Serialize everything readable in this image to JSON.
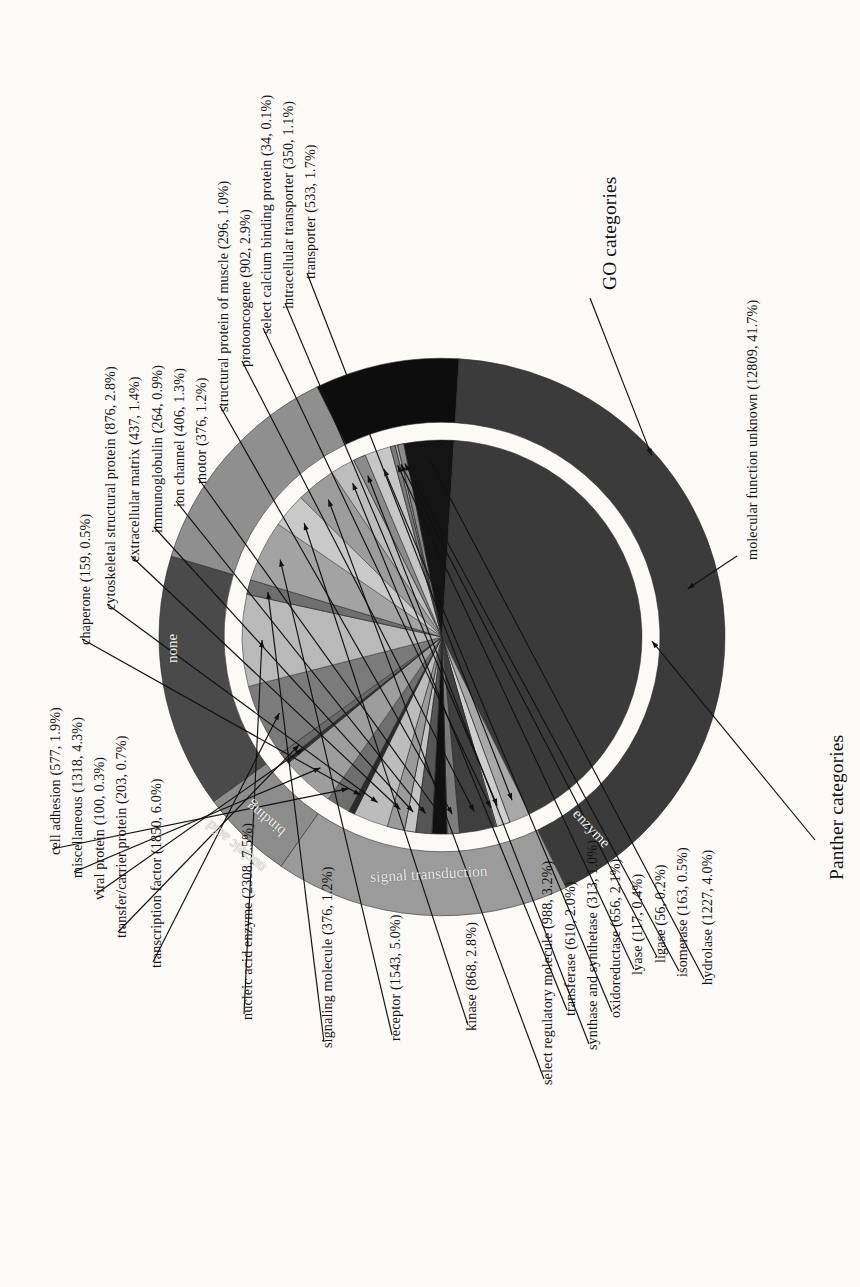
{
  "figure": {
    "title_go": "GO categories",
    "title_panther": "Panther categories"
  },
  "ring_labels": {
    "none": "none",
    "nucleic_acid_binding": "nucleic acid\nbinding",
    "nucleic_acid": "nucleic acid",
    "binding": "binding",
    "signal_transduction": "signal transduction",
    "enzyme": "enzyme"
  },
  "callouts": {
    "molecular_function_unknown": "molecular function unknown (12809, 41.7%)",
    "go_categories": "GO categories",
    "panther_categories": "Panther categories"
  },
  "chart_data": {
    "type": "pie",
    "subtitle": "",
    "xlabel": "",
    "ylabel": "",
    "legend_position": "callout-labels",
    "grid": false,
    "rings": [
      {
        "name": "Panther categories (outer ring)",
        "slices": [
          {
            "label": "molecular function unknown",
            "count": 12809,
            "percent": 41.7,
            "color": "#3b3b3b"
          },
          {
            "label": "none",
            "count": null,
            "percent": null,
            "color": "#8f8f8f"
          },
          {
            "label": "nucleic acid binding",
            "count": null,
            "percent": null,
            "color": "#474747"
          },
          {
            "label": "signal transduction",
            "count": null,
            "percent": null,
            "color": "#8c8c8c"
          },
          {
            "label": "enzyme",
            "count": null,
            "percent": null,
            "color": "#0c0c0c"
          }
        ]
      },
      {
        "name": "GO categories (inner pie)",
        "slices": [
          {
            "label": "molecular function unknown",
            "count": 12809,
            "percent": 41.7,
            "color": "#3a3a3a"
          },
          {
            "label": "transporter",
            "count": 533,
            "percent": 1.7,
            "color": "#a8a8a8"
          },
          {
            "label": "intracellular transporter",
            "count": 350,
            "percent": 1.1,
            "color": "#cfcfcf"
          },
          {
            "label": "select calcium binding protein",
            "count": 34,
            "percent": 0.1,
            "color": "#9b9b9b"
          },
          {
            "label": "protooncogene",
            "count": 902,
            "percent": 2.9,
            "color": "#3f3f3f"
          },
          {
            "label": "structural protein of muscle",
            "count": 296,
            "percent": 1.0,
            "color": "#7d7d7d"
          },
          {
            "label": "motor",
            "count": 376,
            "percent": 1.2,
            "color": "#111111"
          },
          {
            "label": "ion channel",
            "count": 406,
            "percent": 1.3,
            "color": "#565656"
          },
          {
            "label": "immunoglobulin",
            "count": 264,
            "percent": 0.9,
            "color": "#c3c3c3"
          },
          {
            "label": "extracellular matrix",
            "count": 437,
            "percent": 1.4,
            "color": "#9a9a9a"
          },
          {
            "label": "cytoskeletal structural protein",
            "count": 876,
            "percent": 2.8,
            "color": "#bcbcbc"
          },
          {
            "label": "chaperone",
            "count": 159,
            "percent": 0.5,
            "color": "#2b2b2b"
          },
          {
            "label": "cell adhesion",
            "count": 577,
            "percent": 1.9,
            "color": "#6e6e6e"
          },
          {
            "label": "miscellaneous",
            "count": 1318,
            "percent": 4.3,
            "color": "#9d9d9d"
          },
          {
            "label": "viral protein",
            "count": 100,
            "percent": 0.3,
            "color": "#303030"
          },
          {
            "label": "transfer/carrier protein",
            "count": 203,
            "percent": 0.7,
            "color": "#6a6a6a"
          },
          {
            "label": "transcription factor",
            "count": 1850,
            "percent": 6.0,
            "color": "#7b7b7b"
          },
          {
            "label": "nucleic acid enzyme",
            "count": 2308,
            "percent": 7.5,
            "color": "#b9b9b9"
          },
          {
            "label": "signaling molecule",
            "count": 376,
            "percent": 1.2,
            "color": "#6f6f6f"
          },
          {
            "label": "receptor",
            "count": 1543,
            "percent": 5.0,
            "color": "#a3a3a3"
          },
          {
            "label": "kinase",
            "count": 868,
            "percent": 2.8,
            "color": "#c9c9c9"
          },
          {
            "label": "select regulatory molecule",
            "count": 988,
            "percent": 3.2,
            "color": "#9c9c9c"
          },
          {
            "label": "transferase",
            "count": 610,
            "percent": 2.0,
            "color": "#bdbdbd"
          },
          {
            "label": "synthase and synthetase",
            "count": 313,
            "percent": 1.0,
            "color": "#8b8b8b"
          },
          {
            "label": "oxidoreductase",
            "count": 656,
            "percent": 2.1,
            "color": "#c6c6c6"
          },
          {
            "label": "lyase",
            "count": 117,
            "percent": 0.4,
            "color": "#7a7a7a"
          },
          {
            "label": "ligase",
            "count": 56,
            "percent": 0.2,
            "color": "#b0b0b0"
          },
          {
            "label": "isomerase",
            "count": 163,
            "percent": 0.5,
            "color": "#8a8a8a"
          },
          {
            "label": "hydrolase",
            "count": 1227,
            "percent": 4.0,
            "color": "#141414"
          }
        ]
      }
    ]
  },
  "labels": [
    {
      "id": "chaperone",
      "text": "chaperone (159, 0.5%)",
      "x": 78,
      "y": 645
    },
    {
      "id": "cytoskeletal",
      "text": "cytoskeletal structural protein (876, 2.8%)",
      "x": 103,
      "y": 610
    },
    {
      "id": "extracellular-matrix",
      "text": "extracellular matrix (437, 1.4%)",
      "x": 127,
      "y": 562
    },
    {
      "id": "immunoglobulin",
      "text": "immunoglobulin (264, 0.9%)",
      "x": 150,
      "y": 533
    },
    {
      "id": "ion-channel",
      "text": "ion channel (406, 1.3%)",
      "x": 172,
      "y": 507
    },
    {
      "id": "motor",
      "text": "motor (376, 1.2%)",
      "x": 194,
      "y": 484
    },
    {
      "id": "structural-muscle",
      "text": "structural protein of muscle (296, 1.0%)",
      "x": 216,
      "y": 412
    },
    {
      "id": "protooncogene",
      "text": "protooncogene (902, 2.9%)",
      "x": 238,
      "y": 367
    },
    {
      "id": "select-calcium",
      "text": "select calcium binding protein (34, 0.1%)",
      "x": 259,
      "y": 334
    },
    {
      "id": "intracellular-trans",
      "text": "intracellular transporter (350, 1.1%)",
      "x": 281,
      "y": 309
    },
    {
      "id": "transporter",
      "text": "transporter (533, 1.7%)",
      "x": 303,
      "y": 279
    },
    {
      "id": "mol-func-unknown",
      "text": "molecular function unknown (12809, 41.7%)",
      "x": 745,
      "y": 560
    },
    {
      "id": "cell-adhesion",
      "text": "cell adhesion (577, 1.9%)",
      "x": 48,
      "y": 855
    },
    {
      "id": "miscellaneous",
      "text": "miscellaneous (1318, 4.3%)",
      "x": 70,
      "y": 878
    },
    {
      "id": "viral-protein",
      "text": "viral protein (100, 0.3%)",
      "x": 92,
      "y": 900
    },
    {
      "id": "transfer-carrier",
      "text": "transfer/carrier protein (203, 0.7%)",
      "x": 114,
      "y": 938
    },
    {
      "id": "transcription-factor",
      "text": "transcription factor (1850, 6.0%)",
      "x": 149,
      "y": 968
    },
    {
      "id": "nucleic-acid-enzyme",
      "text": "nucleic acid enzyme (2308, 7.5%)",
      "x": 240,
      "y": 1020
    },
    {
      "id": "signaling-molecule",
      "text": "signaling molecule (376, 1.2%)",
      "x": 320,
      "y": 1048
    },
    {
      "id": "receptor",
      "text": "receptor (1543, 5.0%)",
      "x": 388,
      "y": 1041
    },
    {
      "id": "kinase",
      "text": "kinase (868, 2.8%)",
      "x": 464,
      "y": 1031
    },
    {
      "id": "select-regulatory",
      "text": "select regulatory molecule (988, 3.2%)",
      "x": 540,
      "y": 1085
    },
    {
      "id": "transferase",
      "text": "transferase (610, 2.0%)",
      "x": 563,
      "y": 1016
    },
    {
      "id": "synthase",
      "text": "synthase and synthetase (313, 1.0%)",
      "x": 585,
      "y": 1050
    },
    {
      "id": "oxidoreductase",
      "text": "oxidoreductase (656, 2.1%)",
      "x": 608,
      "y": 1018
    },
    {
      "id": "lyase",
      "text": "lyase (117, 0.4%)",
      "x": 630,
      "y": 975
    },
    {
      "id": "ligase",
      "text": "ligase (56, 0.2%)",
      "x": 653,
      "y": 963
    },
    {
      "id": "isomerase",
      "text": "isomerase (163, 0.5%)",
      "x": 675,
      "y": 977
    },
    {
      "id": "hydrolase",
      "text": "hydrolase (1227, 4.0%)",
      "x": 700,
      "y": 985
    },
    {
      "id": "go-categories",
      "text": "GO categories",
      "x": 600,
      "y": 290,
      "big": true
    },
    {
      "id": "panther-categories",
      "text": "Panther categories",
      "x": 827,
      "y": 880,
      "big": true
    }
  ]
}
